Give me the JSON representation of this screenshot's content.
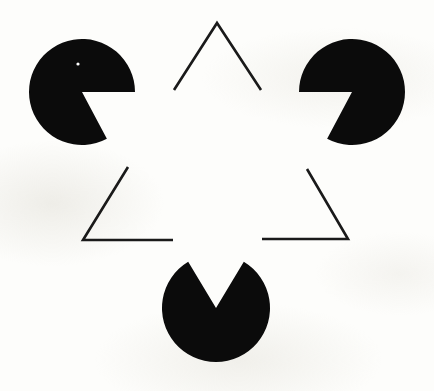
{
  "figure": {
    "canvas": {
      "width": 434,
      "height": 391
    },
    "background_color": "#fdfdfb",
    "ink_color": "#0b0b0b",
    "line_color": "#1a1a1a",
    "line_width": 2.6
  },
  "inducers": [
    {
      "name": "pacman-top-left",
      "cx": 82,
      "cy": 92,
      "r": 53,
      "wedge_start_deg": 0,
      "wedge_end_deg": 62,
      "fill": "#0b0b0b"
    },
    {
      "name": "pacman-top-right",
      "cx": 352,
      "cy": 92,
      "r": 53,
      "wedge_start_deg": 118,
      "wedge_end_deg": 180,
      "fill": "#0b0b0b"
    },
    {
      "name": "pacman-bottom",
      "cx": 216,
      "cy": 308,
      "r": 54,
      "wedge_start_deg": 239,
      "wedge_end_deg": 301,
      "fill": "#0b0b0b"
    }
  ],
  "speck": {
    "name": "white-speck",
    "cx": 78,
    "cy": 64,
    "r": 1.6,
    "fill": "#ffffff"
  },
  "line_segments": [
    {
      "name": "apex-angle-top",
      "points": [
        [
          174,
          90
        ],
        [
          217,
          23
        ],
        [
          261,
          90
        ]
      ]
    },
    {
      "name": "corner-angle-bottom-left",
      "points": [
        [
          128,
          167
        ],
        [
          83,
          240
        ],
        [
          173,
          240
        ]
      ]
    },
    {
      "name": "corner-angle-bottom-right",
      "points": [
        [
          307,
          169
        ],
        [
          348,
          239
        ],
        [
          262,
          239
        ]
      ]
    }
  ],
  "illusory_triangle": {
    "name": "subjective-triangle",
    "vertices": [
      [
        217,
        26
      ],
      [
        86,
        243
      ],
      [
        348,
        243
      ]
    ],
    "visible": false
  }
}
